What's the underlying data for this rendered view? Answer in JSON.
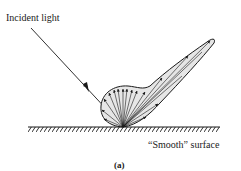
{
  "figure": {
    "incident_label": "Incident light",
    "surface_label": "“Smooth” surface",
    "caption": "(a)",
    "colors": {
      "ink": "#1a1a1a",
      "lobe_fill": "#e6e6e6",
      "background": "#ffffff"
    }
  }
}
